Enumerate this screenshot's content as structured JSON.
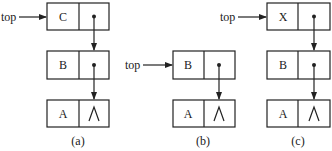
{
  "diagram": {
    "pointer_label": "top",
    "null_symbol": "∧",
    "panels": [
      {
        "caption": "(a)",
        "top_points_to": "C",
        "nodes": [
          {
            "data": "C",
            "next": "B"
          },
          {
            "data": "B",
            "next": "A"
          },
          {
            "data": "A",
            "next": null
          }
        ]
      },
      {
        "caption": "(b)",
        "top_points_to": "B",
        "nodes": [
          {
            "data": "B",
            "next": "A"
          },
          {
            "data": "A",
            "next": null
          }
        ]
      },
      {
        "caption": "(c)",
        "top_points_to": "X",
        "nodes": [
          {
            "data": "X",
            "next": "B"
          },
          {
            "data": "B",
            "next": "A"
          },
          {
            "data": "A",
            "next": null
          }
        ]
      }
    ]
  }
}
